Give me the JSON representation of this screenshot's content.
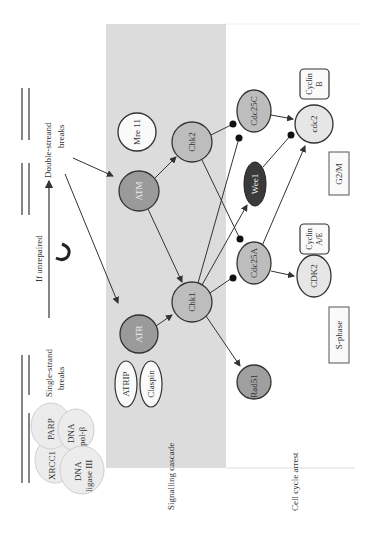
{
  "orientation": "rotated-90-ccw",
  "colors": {
    "band": "#dcdcdc",
    "kinase_dark": "#9a9a9a",
    "node_mid": "#bdbdbd",
    "node_light": "#e6e6e6",
    "wee1": "#3a3a3a",
    "stroke": "#333333"
  },
  "top": {
    "single_strand": "Single-strand breaks",
    "single_strand_l1": "Single-strand",
    "single_strand_l2": "breaks",
    "double_strand_l1": "Double-streand",
    "double_strand_l2": "breaks",
    "if_unrepaired": "If unrepaired",
    "repair_complex": [
      "XRCC1",
      "PARP",
      "DNA",
      "pol-β",
      "DNA",
      "ligase III"
    ]
  },
  "sections": {
    "signalling": "Signalling cascade",
    "arrest": "Cell cycle arrest"
  },
  "nodes": {
    "mre11": "Mre 11",
    "atm": "ATM",
    "atr": "ATR",
    "atrip": "ATRIP",
    "claspin": "Claspin",
    "chk2": "Chk2",
    "chk1": "Chk1",
    "rad51": "Rad51",
    "cdc25c": "Cdc25C",
    "wee1": "Wee1",
    "cdc25a": "Cdc25A",
    "cdc2": "cdc2",
    "cdk2": "CDK2",
    "cyclin_b_l1": "Cyclin",
    "cyclin_b_l2": "B",
    "cyclin_ae_l1": "Cyclin",
    "cyclin_ae_l2": "A/E"
  },
  "phases": {
    "g2m": "G2/M",
    "s": "S-phase"
  },
  "edges": [
    {
      "from": "ds_breaks",
      "to": "ATM",
      "type": "arrow"
    },
    {
      "from": "ds_breaks",
      "to": "ATR",
      "type": "arrow"
    },
    {
      "from": "ATM",
      "to": "Chk2",
      "type": "arrow"
    },
    {
      "from": "ATM",
      "to": "Chk1",
      "type": "arrow"
    },
    {
      "from": "ATR",
      "to": "Chk1",
      "type": "arrow"
    },
    {
      "from": "Chk2",
      "to": "Cdc25C",
      "type": "inhibit"
    },
    {
      "from": "Chk2",
      "to": "Cdc25A",
      "type": "inhibit"
    },
    {
      "from": "Chk1",
      "to": "Cdc25C",
      "type": "inhibit"
    },
    {
      "from": "Chk1",
      "to": "Wee1",
      "type": "arrow"
    },
    {
      "from": "Chk1",
      "to": "Cdc25A",
      "type": "inhibit"
    },
    {
      "from": "Chk1",
      "to": "Rad51",
      "type": "arrow"
    },
    {
      "from": "Cdc25C",
      "to": "cdc2",
      "type": "arrow"
    },
    {
      "from": "Wee1",
      "to": "cdc2",
      "type": "inhibit"
    },
    {
      "from": "Cdc25A",
      "to": "cdc2",
      "type": "arrow"
    },
    {
      "from": "Cdc25A",
      "to": "CDK2",
      "type": "arrow"
    }
  ]
}
